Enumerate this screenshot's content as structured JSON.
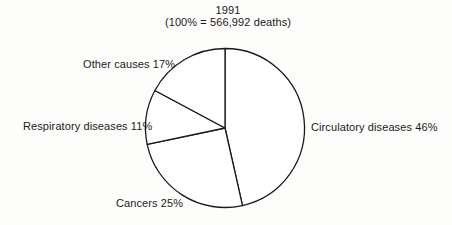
{
  "chart_data": {
    "type": "pie",
    "title": "1991",
    "subtitle": "(100% = 566,992 deaths)",
    "total": 566992,
    "start_angle_deg": 0,
    "direction": "clockwise",
    "slices": [
      {
        "label": "Circulatory diseases",
        "value": 46,
        "display": "Circulatory diseases 46%"
      },
      {
        "label": "Cancers",
        "value": 25,
        "display": "Cancers 25%"
      },
      {
        "label": "Respiratory diseases",
        "value": 11,
        "display": "Respiratory diseases 11%"
      },
      {
        "label": "Other causes",
        "value": 17,
        "display": "Other causes 17%"
      }
    ],
    "legend": "none (labels placed beside slices)",
    "fill": "#ffffff",
    "stroke": "#1a1a1a"
  }
}
